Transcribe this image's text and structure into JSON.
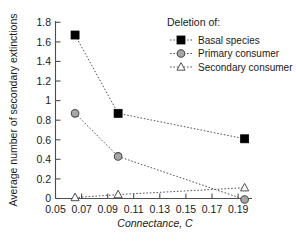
{
  "chart_data": {
    "type": "line",
    "title": "",
    "xlabel": "Connectance, C",
    "ylabel": "Average number of secondary extinctions",
    "xlim": [
      0.05,
      0.202
    ],
    "ylim": [
      0,
      1.8
    ],
    "grid": false,
    "legend_position": "top-right",
    "legend_title": "Deletion of:",
    "xticks": [
      "0.05",
      "0.07",
      "0.09",
      "0.11",
      "0.13",
      "0.15",
      "0.17",
      "0.19"
    ],
    "xtick_values": [
      0.05,
      0.07,
      0.09,
      0.11,
      0.13,
      0.15,
      0.17,
      0.19
    ],
    "yticks": [
      "0",
      "0.2",
      "0.4",
      "0.6",
      "0.8",
      "1",
      "1.2",
      "1.4",
      "1.6",
      "1.8"
    ],
    "ytick_values": [
      0,
      0.2,
      0.4,
      0.6,
      0.8,
      1.0,
      1.2,
      1.4,
      1.6,
      1.8
    ],
    "x": [
      0.065,
      0.098,
      0.195
    ],
    "series": [
      {
        "name": "Basal species",
        "marker": "filled-square",
        "marker_color": "#000000",
        "line_color": "#555555",
        "values": [
          1.67,
          0.87,
          0.61
        ]
      },
      {
        "name": "Primary consumer",
        "marker": "gray-circle",
        "marker_color": "#a6a6a6",
        "line_color": "#555555",
        "values": [
          0.87,
          0.43,
          -0.01
        ]
      },
      {
        "name": "Secondary consumer",
        "marker": "open-triangle",
        "marker_color": "#ffffff",
        "line_color": "#555555",
        "values": [
          0.01,
          0.04,
          0.11
        ]
      }
    ]
  }
}
